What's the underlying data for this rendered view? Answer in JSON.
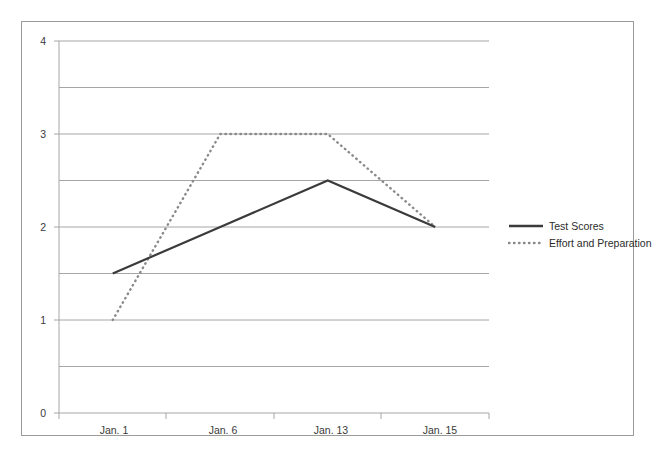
{
  "chart_data": {
    "type": "line",
    "title": "",
    "subtitle": "",
    "xlabel": "",
    "ylabel": "",
    "categories": [
      "Jan. 1",
      "Jan. 6",
      "Jan. 13",
      "Jan. 15"
    ],
    "series": [
      {
        "name": "Test Scores",
        "style": "solid",
        "color": "#3b3b3b",
        "values": [
          1.5,
          2.0,
          2.5,
          2.0
        ]
      },
      {
        "name": "Effort and Preparation",
        "style": "dotted",
        "color": "#8a8a8a",
        "values": [
          1.0,
          3.0,
          3.0,
          2.0
        ]
      }
    ],
    "ylim": [
      0,
      4
    ],
    "y_ticks": [
      0,
      1,
      2,
      3,
      4
    ],
    "y_tick_labels": [
      "0",
      "1",
      "2",
      "3",
      "4"
    ],
    "gridlines": [
      0,
      0.5,
      1,
      1.5,
      2,
      2.5,
      3,
      3.5,
      4
    ],
    "grid": true,
    "grid_color": "#a6a6a6",
    "axis_color": "#a6a6a6",
    "border_color": "#9b9b9b",
    "background": "#ffffff",
    "legend_position": "right"
  },
  "legend": {
    "entries": [
      {
        "label": "Test Scores",
        "swatch": "solid-line-swatch"
      },
      {
        "label": "Effort and Preparation",
        "swatch": "dotted-line-swatch"
      }
    ]
  },
  "axes": {
    "y_labels": [
      "4",
      "3",
      "2",
      "1",
      "0"
    ],
    "x_labels": [
      "Jan. 1",
      "Jan. 6",
      "Jan. 13",
      "Jan. 15"
    ]
  }
}
